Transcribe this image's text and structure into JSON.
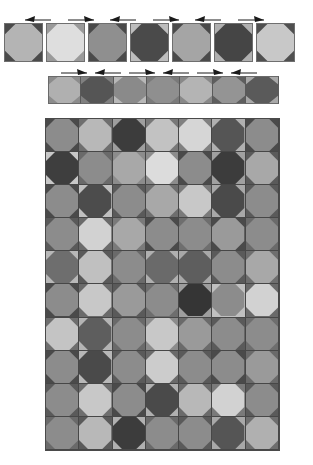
{
  "figure": {
    "background_color": "#ffffff",
    "palette": {
      "very_light": "#dcdcdc",
      "light": "#bcbcbc",
      "medium_light": "#a8a8a8",
      "medium": "#8c8c8c",
      "medium_dark": "#6e6e6e",
      "dark": "#555555",
      "very_dark": "#3a3a3a"
    },
    "caption_top_left": "",
    "caption_top_right": ""
  },
  "top_strip": {
    "label": "tile-row-top",
    "count": 7,
    "tile_size_px": 39,
    "tiles": [
      {
        "index": 1,
        "octagon": "#b4b4b4",
        "corner": "#4a4a4a",
        "arrow": "left"
      },
      {
        "index": 2,
        "octagon": "#dedede",
        "corner": "#9a9a9a",
        "arrow": "right"
      },
      {
        "index": 3,
        "octagon": "#8f8f8f",
        "corner": "#4a4a4a",
        "arrow": "left"
      },
      {
        "index": 4,
        "octagon": "#4a4a4a",
        "corner": "#bdbdbd",
        "arrow": "right"
      },
      {
        "index": 5,
        "octagon": "#a5a5a5",
        "corner": "#4a4a4a",
        "arrow": "left"
      },
      {
        "index": 6,
        "octagon": "#454545",
        "corner": "#b0b0b0",
        "arrow": "right"
      },
      {
        "index": 7,
        "octagon": "#c8c8c8",
        "corner": "#4f4f4f",
        "arrow": "none"
      }
    ],
    "arrows": [
      "left",
      "right",
      "left",
      "right",
      "left",
      "right"
    ]
  },
  "second_strip": {
    "label": "tile-row-second",
    "count": 7,
    "tiles": [
      {
        "index": 1,
        "octagon": "#b0b0b0",
        "corner": "#8c8c8c",
        "arrow": "right"
      },
      {
        "index": 2,
        "octagon": "#555555",
        "corner": "#808080",
        "arrow": "left"
      },
      {
        "index": 3,
        "octagon": "#8a8a8a",
        "corner": "#b8b8b8",
        "arrow": "right"
      },
      {
        "index": 4,
        "octagon": "#8f8f8f",
        "corner": "#7a7a7a",
        "arrow": "left"
      },
      {
        "index": 5,
        "octagon": "#b4b4b4",
        "corner": "#888888",
        "arrow": "right"
      },
      {
        "index": 6,
        "octagon": "#949494",
        "corner": "#5e5e5e",
        "arrow": "left"
      },
      {
        "index": 7,
        "octagon": "#5a5a5a",
        "corner": "#a8a8a8",
        "arrow": "none"
      }
    ],
    "arrows": [
      "right",
      "left",
      "right",
      "left",
      "right",
      "left"
    ]
  },
  "main_grid": {
    "label": "tile-grid-main",
    "columns": 7,
    "rows": 10,
    "cells": [
      [
        {
          "octagon": "#8c8c8c",
          "corner": "#4a4a4a"
        },
        {
          "octagon": "#b8b8b8",
          "corner": "#6e6e6e"
        },
        {
          "octagon": "#3c3c3c",
          "corner": "#9e9e9e"
        },
        {
          "octagon": "#c2c2c2",
          "corner": "#787878"
        },
        {
          "octagon": "#d6d6d6",
          "corner": "#808080"
        },
        {
          "octagon": "#555555",
          "corner": "#b0b0b0"
        },
        {
          "octagon": "#8c8c8c",
          "corner": "#4a4a4a"
        }
      ],
      [
        {
          "octagon": "#3e3e3e",
          "corner": "#c8c8c8"
        },
        {
          "octagon": "#8c8c8c",
          "corner": "#6a6a6a"
        },
        {
          "octagon": "#a8a8a8",
          "corner": "#8c8c8c"
        },
        {
          "octagon": "#dcdcdc",
          "corner": "#8c8c8c"
        },
        {
          "octagon": "#8c8c8c",
          "corner": "#4a4a4a"
        },
        {
          "octagon": "#3c3c3c",
          "corner": "#a0a0a0"
        },
        {
          "octagon": "#a8a8a8",
          "corner": "#5a5a5a"
        }
      ],
      [
        {
          "octagon": "#8c8c8c",
          "corner": "#4a4a4a"
        },
        {
          "octagon": "#4c4c4c",
          "corner": "#c0c0c0"
        },
        {
          "octagon": "#8c8c8c",
          "corner": "#5a5a5a"
        },
        {
          "octagon": "#a8a8a8",
          "corner": "#6e6e6e"
        },
        {
          "octagon": "#c8c8c8",
          "corner": "#7a7a7a"
        },
        {
          "octagon": "#4a4a4a",
          "corner": "#a8a8a8"
        },
        {
          "octagon": "#8c8c8c",
          "corner": "#5a5a5a"
        }
      ],
      [
        {
          "octagon": "#8c8c8c",
          "corner": "#5a5a5a"
        },
        {
          "octagon": "#d2d2d2",
          "corner": "#6a6a6a"
        },
        {
          "octagon": "#a8a8a8",
          "corner": "#7a7a7a"
        },
        {
          "octagon": "#8c8c8c",
          "corner": "#4a4a4a"
        },
        {
          "octagon": "#8c8c8c",
          "corner": "#6e6e6e"
        },
        {
          "octagon": "#9a9a9a",
          "corner": "#4a4a4a"
        },
        {
          "octagon": "#8c8c8c",
          "corner": "#6a6a6a"
        }
      ],
      [
        {
          "octagon": "#6e6e6e",
          "corner": "#b8b8b8"
        },
        {
          "octagon": "#c0c0c0",
          "corner": "#5a5a5a"
        },
        {
          "octagon": "#8c8c8c",
          "corner": "#6a6a6a"
        },
        {
          "octagon": "#6a6a6a",
          "corner": "#b0b0b0"
        },
        {
          "octagon": "#5e5e5e",
          "corner": "#a8a8a8"
        },
        {
          "octagon": "#8c8c8c",
          "corner": "#5a5a5a"
        },
        {
          "octagon": "#a8a8a8",
          "corner": "#6e6e6e"
        }
      ],
      [
        {
          "octagon": "#8c8c8c",
          "corner": "#4a4a4a"
        },
        {
          "octagon": "#c8c8c8",
          "corner": "#6a6a6a"
        },
        {
          "octagon": "#9a9a9a",
          "corner": "#5a5a5a"
        },
        {
          "octagon": "#8c8c8c",
          "corner": "#6e6e6e"
        },
        {
          "octagon": "#353535",
          "corner": "#9e9e9e"
        },
        {
          "octagon": "#8c8c8c",
          "corner": "#c0c0c0"
        },
        {
          "octagon": "#d2d2d2",
          "corner": "#6a6a6a"
        }
      ],
      [
        {
          "octagon": "#c4c4c4",
          "corner": "#6e6e6e"
        },
        {
          "octagon": "#5e5e5e",
          "corner": "#b4b4b4"
        },
        {
          "octagon": "#8c8c8c",
          "corner": "#6a6a6a"
        },
        {
          "octagon": "#c8c8c8",
          "corner": "#8c8c8c"
        },
        {
          "octagon": "#9a9a9a",
          "corner": "#6a6a6a"
        },
        {
          "octagon": "#8c8c8c",
          "corner": "#5a5a5a"
        },
        {
          "octagon": "#8c8c8c",
          "corner": "#6e6e6e"
        }
      ],
      [
        {
          "octagon": "#8c8c8c",
          "corner": "#4a4a4a"
        },
        {
          "octagon": "#4a4a4a",
          "corner": "#b8b8b8"
        },
        {
          "octagon": "#8c8c8c",
          "corner": "#5a5a5a"
        },
        {
          "octagon": "#cccccc",
          "corner": "#6a6a6a"
        },
        {
          "octagon": "#8c8c8c",
          "corner": "#5a5a5a"
        },
        {
          "octagon": "#8c8c8c",
          "corner": "#4a4a4a"
        },
        {
          "octagon": "#9a9a9a",
          "corner": "#6a6a6a"
        }
      ],
      [
        {
          "octagon": "#8c8c8c",
          "corner": "#5a5a5a"
        },
        {
          "octagon": "#c8c8c8",
          "corner": "#6e6e6e"
        },
        {
          "octagon": "#8c8c8c",
          "corner": "#4a4a4a"
        },
        {
          "octagon": "#4a4a4a",
          "corner": "#b0b0b0"
        },
        {
          "octagon": "#b8b8b8",
          "corner": "#6a6a6a"
        },
        {
          "octagon": "#d2d2d2",
          "corner": "#7a7a7a"
        },
        {
          "octagon": "#8c8c8c",
          "corner": "#5a5a5a"
        }
      ],
      [
        {
          "octagon": "#8c8c8c",
          "corner": "#6a6a6a"
        },
        {
          "octagon": "#b8b8b8",
          "corner": "#5a5a5a"
        },
        {
          "octagon": "#3c3c3c",
          "corner": "#b0b0b0"
        },
        {
          "octagon": "#8c8c8c",
          "corner": "#6a6a6a"
        },
        {
          "octagon": "#8c8c8c",
          "corner": "#5a5a5a"
        },
        {
          "octagon": "#555555",
          "corner": "#a8a8a8"
        },
        {
          "octagon": "#b0b0b0",
          "corner": "#6e6e6e"
        }
      ]
    ]
  }
}
